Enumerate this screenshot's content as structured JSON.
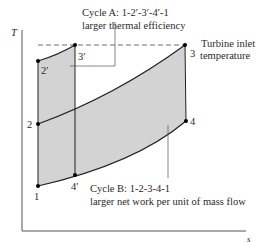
{
  "axes": {
    "y_label": "T",
    "x_label": "s"
  },
  "points": {
    "p1": {
      "label": "1"
    },
    "p2": {
      "label": "2"
    },
    "p3": {
      "label": "3"
    },
    "p4": {
      "label": "4"
    },
    "p2p": {
      "label": "2′"
    },
    "p3p": {
      "label": "3′"
    },
    "p4p": {
      "label": "4′"
    }
  },
  "annotations": {
    "cycle_a_line1": "Cycle A:  1-2′-3′-4′-1",
    "cycle_a_line2": "larger thermal efficiency",
    "cycle_b_line1": "Cycle B:  1-2-3-4-1",
    "cycle_b_line2": "larger net work per unit of mass flow",
    "turbine_line1": "Turbine inlet",
    "turbine_line2": "temperature"
  },
  "colors": {
    "shade": "#d3d3d3",
    "line": "#222222",
    "axis": "#555555"
  }
}
